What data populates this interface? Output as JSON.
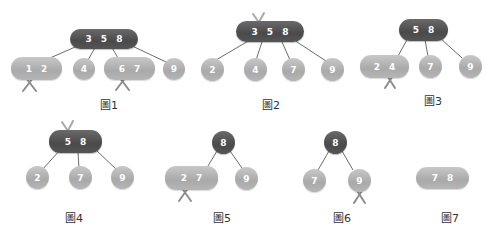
{
  "colors": {
    "internal_node": "#555555",
    "leaf_node": "#b0b0b0",
    "edge": "#666666",
    "delete_mark": "#777777"
  },
  "figures": [
    {
      "caption": "圖1",
      "root": "3 5 8",
      "children": [
        "1 2",
        "4",
        "6 7",
        "9"
      ],
      "deleted_marks": [
        "1",
        "6"
      ]
    },
    {
      "caption": "圖2",
      "root": "3 5 8",
      "children": [
        "2",
        "4",
        "7",
        "9"
      ],
      "deleted_marks": [
        "3"
      ]
    },
    {
      "caption": "圖3",
      "root": "5 8",
      "children": [
        "2 4",
        "7",
        "9"
      ],
      "deleted_marks": [
        "4"
      ]
    },
    {
      "caption": "圖4",
      "root": "5 8",
      "children": [
        "2",
        "7",
        "9"
      ],
      "deleted_marks": [
        "5"
      ]
    },
    {
      "caption": "圖5",
      "root": "8",
      "children": [
        "2 7",
        "9"
      ],
      "deleted_marks": [
        "2"
      ]
    },
    {
      "caption": "圖6",
      "root": "8",
      "children": [
        "7",
        "9"
      ],
      "deleted_marks": [
        "9"
      ]
    },
    {
      "caption": "圖7",
      "root": "7 8",
      "children": [],
      "deleted_marks": []
    }
  ]
}
